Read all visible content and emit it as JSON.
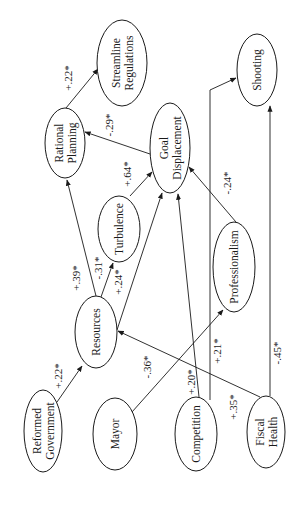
{
  "diagram": {
    "type": "path-model",
    "orientation": "rotated-90-ccw",
    "nodes": [
      {
        "id": "reformed_government",
        "lines": [
          "Reformed",
          "Government"
        ],
        "cx": 43,
        "cy": 431,
        "rx": 19,
        "ry": 41
      },
      {
        "id": "mayor",
        "lines": [
          "Mayor"
        ],
        "cx": 115,
        "cy": 434,
        "rx": 22,
        "ry": 36
      },
      {
        "id": "competition",
        "lines": [
          "Competition"
        ],
        "cx": 196,
        "cy": 434,
        "rx": 21,
        "ry": 37
      },
      {
        "id": "fiscal_health",
        "lines": [
          "Fiscal",
          "Health"
        ],
        "cx": 266,
        "cy": 432,
        "rx": 19,
        "ry": 36
      },
      {
        "id": "resources",
        "lines": [
          "Resources"
        ],
        "cx": 96,
        "cy": 332,
        "rx": 21,
        "ry": 36
      },
      {
        "id": "turbulence",
        "lines": [
          "Turbulence"
        ],
        "cx": 119,
        "cy": 229,
        "rx": 21,
        "ry": 33
      },
      {
        "id": "professionalism",
        "lines": [
          "Professionalism"
        ],
        "cx": 234,
        "cy": 267,
        "rx": 21,
        "ry": 45
      },
      {
        "id": "rational_planning",
        "lines": [
          "Rational",
          "Planning"
        ],
        "cx": 65,
        "cy": 143,
        "rx": 20,
        "ry": 35
      },
      {
        "id": "goal_displacement",
        "lines": [
          "Goal",
          "Displacement"
        ],
        "cx": 170,
        "cy": 148,
        "rx": 20,
        "ry": 45
      },
      {
        "id": "streamline_regulations",
        "lines": [
          "Streamline",
          "Regulations"
        ],
        "cx": 122,
        "cy": 63,
        "rx": 25,
        "ry": 43
      },
      {
        "id": "shooting",
        "lines": [
          "Shooting"
        ],
        "cx": 257,
        "cy": 70,
        "rx": 20,
        "ry": 36
      }
    ],
    "edges": [
      {
        "from": "reformed_government",
        "to": "resources",
        "label": "+.22*",
        "points": [
          [
            57,
            402
          ],
          [
            82,
            366
          ]
        ],
        "lx": 62,
        "ly": 376
      },
      {
        "from": "resources",
        "to": "rational_planning",
        "label": "+.39*",
        "points": [
          [
            96,
            296
          ],
          [
            67,
            180
          ]
        ],
        "lx": 80,
        "ly": 278
      },
      {
        "from": "resources",
        "to": "turbulence",
        "label": "-.31*",
        "points": [
          [
            101,
            297
          ],
          [
            113,
            263
          ]
        ],
        "lx": 102,
        "ly": 268
      },
      {
        "from": "resources",
        "to": "goal_displacement",
        "label": "+.24*",
        "points": [
          [
            117,
            330
          ],
          [
            162,
            193
          ]
        ],
        "lx": 122,
        "ly": 282
      },
      {
        "from": "rational_planning",
        "to": "streamline_regulations",
        "label": "+.22*",
        "points": [
          [
            66,
            108
          ],
          [
            98,
            69
          ]
        ],
        "lx": 72,
        "ly": 78
      },
      {
        "from": "goal_displacement",
        "to": "rational_planning",
        "label": "-.29*",
        "points": [
          [
            150,
            154
          ],
          [
            85,
            132
          ]
        ],
        "lx": 113,
        "ly": 125
      },
      {
        "from": "turbulence",
        "to": "goal_displacement",
        "label": "+.64*",
        "points": [
          [
            130,
            196
          ],
          [
            152,
            172
          ]
        ],
        "lx": 131,
        "ly": 174
      },
      {
        "from": "professionalism",
        "to": "goal_displacement",
        "label": "-.24*",
        "points": [
          [
            236,
            222
          ],
          [
            189,
            167
          ]
        ],
        "lx": 231,
        "ly": 183
      },
      {
        "from": "mayor",
        "to": "professionalism",
        "label": "-.36*",
        "points": [
          [
            132,
            412
          ],
          [
            223,
            310
          ]
        ],
        "lx": 151,
        "ly": 367
      },
      {
        "from": "competition",
        "to": "goal_displacement",
        "label": "+.20*",
        "points": [
          [
            199,
            397
          ],
          [
            178,
            194
          ]
        ],
        "lx": 195,
        "ly": 382
      },
      {
        "from": "competition",
        "to": "shooting",
        "label": "+.21*",
        "points": [
          [
            210,
            400
          ],
          [
            210,
            90
          ],
          [
            236,
            78
          ]
        ],
        "lx": 221,
        "ly": 351
      },
      {
        "from": "fiscal_health",
        "to": "resources",
        "label": "+.35*",
        "points": [
          [
            260,
            397
          ],
          [
            118,
            331
          ]
        ],
        "lx": 237,
        "ly": 407
      },
      {
        "from": "fiscal_health",
        "to": "shooting",
        "label": "-.45*",
        "points": [
          [
            270,
            396
          ],
          [
            270,
            106
          ]
        ],
        "lx": 281,
        "ly": 353
      }
    ]
  }
}
